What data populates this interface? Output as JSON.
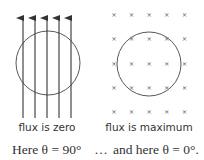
{
  "left_panel": {
    "caption": "flux is zero",
    "field_lines": 5,
    "field_direction": "upward arrows (parallel to loop plane)"
  },
  "right_panel": {
    "caption": "flux is maximum",
    "field_grid_rows": 5,
    "field_grid_cols": 5,
    "field_symbol": "×",
    "field_direction": "into page (perpendicular to loop plane)"
  },
  "bottom_line": {
    "left_text": "Here θ = 90°",
    "ellipsis": "…",
    "right_text": "and here θ = 0°."
  },
  "colors": {
    "line": "#333333",
    "background": "#ffffff"
  }
}
